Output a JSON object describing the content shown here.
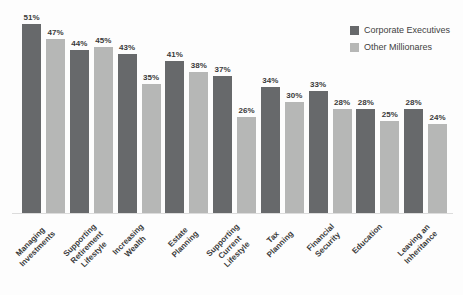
{
  "chart_data": {
    "type": "bar",
    "title": "",
    "xlabel": "",
    "ylabel": "",
    "value_suffix": "%",
    "ylim": [
      0,
      55
    ],
    "grid": false,
    "legend_position": "top-right",
    "axis_line_color": "#dcdcdc",
    "label_color": "#3a3a3a",
    "categories": [
      "Managing Investments",
      "Supporting Retirement Lifestyle",
      "Increasing Wealth",
      "Estate Planning",
      "Supporting Current Lifestyle",
      "Tax Planning",
      "Financial Security",
      "Education",
      "Leaving an Inheritance"
    ],
    "category_lines": [
      [
        "Managing",
        "Investments"
      ],
      [
        "Supporting",
        "Retirement Lifestyle"
      ],
      [
        "Increasing Wealth"
      ],
      [
        "Estate Planning"
      ],
      [
        "Supporting Current",
        "Lifestyle"
      ],
      [
        "Tax Planning"
      ],
      [
        "Financial Security"
      ],
      [
        "Education"
      ],
      [
        "Leaving an",
        "Inheritance"
      ]
    ],
    "series": [
      {
        "name": "Corporate Executives",
        "color": "#67696b",
        "values": [
          51,
          44,
          43,
          41,
          37,
          34,
          33,
          28,
          28
        ]
      },
      {
        "name": "Other Millionares",
        "color": "#b6b7b6",
        "values": [
          47,
          45,
          35,
          38,
          26,
          30,
          28,
          25,
          24
        ]
      }
    ]
  }
}
